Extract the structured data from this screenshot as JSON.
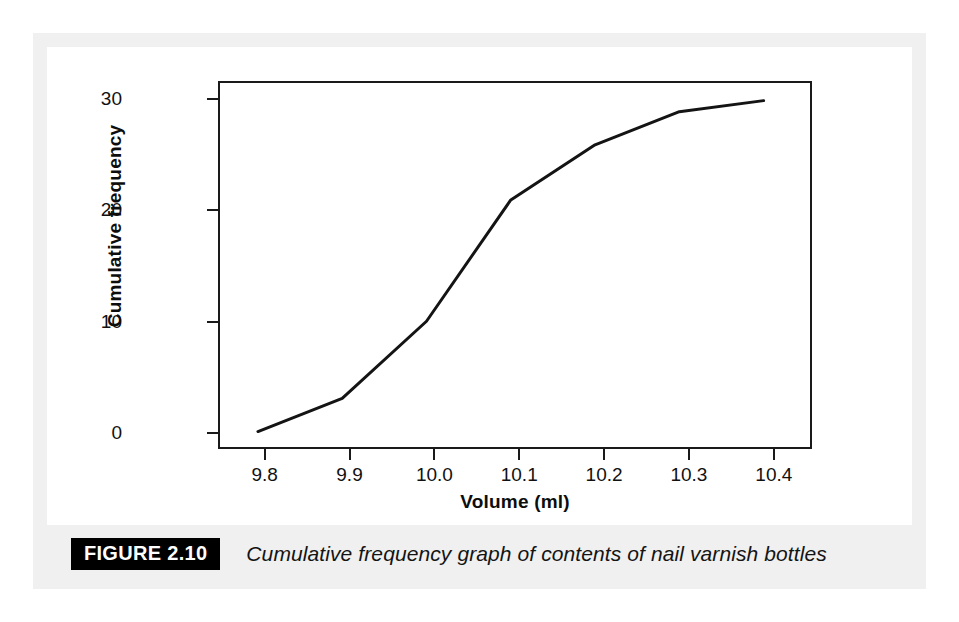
{
  "figure": {
    "badge_label": "FIGURE 2.10",
    "caption": "Cumulative frequency graph of contents of nail varnish bottles"
  },
  "colors": {
    "curve": "#141414",
    "axis": "#1a1a1a",
    "panel": "#f0f0f0",
    "page": "#ffffff",
    "badge_bg": "#000000",
    "badge_fg": "#ffffff"
  },
  "chart_data": {
    "type": "line",
    "title": "",
    "subtitle": "",
    "xlabel": "Volume (ml)",
    "ylabel": "Cumulative frequency",
    "xlim": [
      9.745,
      10.445
    ],
    "ylim": [
      -1.4,
      31.6
    ],
    "xticks": [
      9.8,
      9.9,
      10.0,
      10.1,
      10.2,
      10.3,
      10.4
    ],
    "xtick_labels": [
      "9.8",
      "9.9",
      "10.0",
      "10.1",
      "10.2",
      "10.3",
      "10.4"
    ],
    "yticks": [
      0,
      10,
      20,
      30
    ],
    "ytick_labels": [
      "0",
      "10",
      "20",
      "30"
    ],
    "grid": false,
    "legend": false,
    "legend_position": "none",
    "series": [
      {
        "name": "Cumulative frequency",
        "x": [
          9.79,
          9.89,
          9.99,
          10.09,
          10.19,
          10.29,
          10.39
        ],
        "values": [
          0,
          3,
          10,
          21,
          26,
          29,
          30
        ],
        "color": "#141414",
        "line_width": 3,
        "markers": false
      }
    ],
    "annotations": []
  }
}
